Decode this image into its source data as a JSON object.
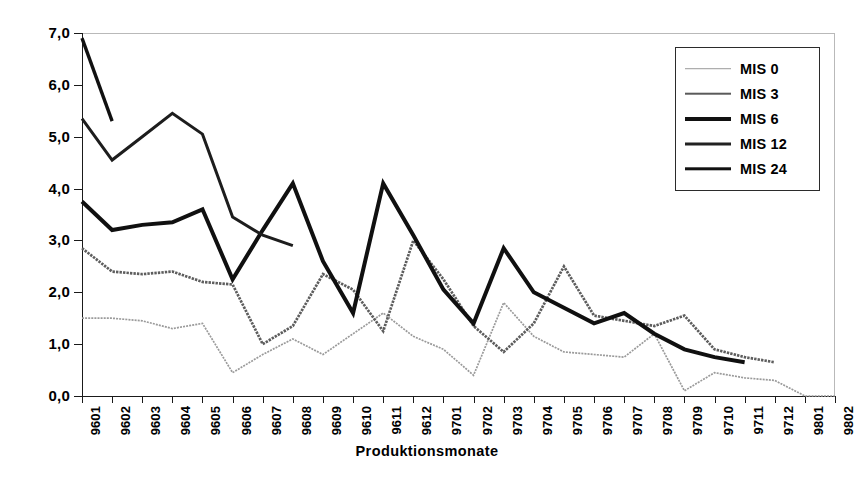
{
  "chart_data": {
    "type": "line",
    "title": "",
    "xlabel": "Produktionsmonate",
    "ylabel": "",
    "categories": [
      "9601",
      "9602",
      "9603",
      "9604",
      "9605",
      "9606",
      "9607",
      "9608",
      "9609",
      "9610",
      "9611",
      "9612",
      "9701",
      "9702",
      "9703",
      "9704",
      "9705",
      "9706",
      "9707",
      "9708",
      "9709",
      "9710",
      "9711",
      "9712",
      "9801",
      "9802"
    ],
    "ylim": [
      0,
      7
    ],
    "ytick_labels": [
      "0,0",
      "1,0",
      "2,0",
      "3,0",
      "4,0",
      "5,0",
      "6,0",
      "7,0"
    ],
    "ytick_values": [
      0,
      1,
      2,
      3,
      4,
      5,
      6,
      7
    ],
    "grid": false,
    "legend_position": "top-right",
    "series": [
      {
        "name": "MIS 0",
        "line_weight": 1.4,
        "style": "dotted-thin",
        "values": [
          1.5,
          1.5,
          1.45,
          1.3,
          1.4,
          0.45,
          0.8,
          1.1,
          0.8,
          1.2,
          1.6,
          1.15,
          0.9,
          0.4,
          1.8,
          1.15,
          0.85,
          0.8,
          0.75,
          1.2,
          0.1,
          0.45,
          0.35,
          0.3,
          0.0,
          0.0
        ]
      },
      {
        "name": "MIS 3",
        "line_weight": 2.6,
        "style": "medium",
        "values": [
          2.85,
          2.4,
          2.35,
          2.4,
          2.2,
          2.15,
          1.0,
          1.35,
          2.35,
          2.05,
          1.25,
          3.0,
          2.25,
          1.35,
          0.85,
          1.4,
          2.5,
          1.55,
          1.45,
          1.35,
          1.55,
          0.9,
          0.75,
          0.65,
          null,
          null
        ]
      },
      {
        "name": "MIS 6",
        "line_weight": 3.6,
        "style": "thick",
        "values": [
          3.75,
          3.2,
          3.3,
          3.35,
          3.6,
          2.25,
          3.2,
          4.1,
          2.6,
          1.6,
          4.1,
          3.1,
          2.05,
          1.4,
          2.85,
          2.0,
          1.7,
          1.4,
          1.6,
          1.2,
          0.9,
          0.75,
          0.65,
          null,
          null,
          null
        ]
      },
      {
        "name": "MIS 12",
        "line_weight": 2.8,
        "style": "medium-thick",
        "values": [
          5.35,
          4.55,
          5.0,
          5.45,
          5.05,
          3.45,
          3.1,
          2.9,
          null,
          null,
          null,
          null,
          null,
          null,
          null,
          null,
          null,
          null,
          null,
          null,
          null,
          null,
          null,
          null,
          null,
          null
        ]
      },
      {
        "name": "MIS 24",
        "line_weight": 3.2,
        "style": "thick-dark",
        "values": [
          6.9,
          5.3,
          null,
          null,
          null,
          null,
          null,
          null,
          null,
          null,
          null,
          null,
          null,
          null,
          null,
          null,
          null,
          null,
          null,
          null,
          null,
          null,
          null,
          null,
          null,
          null
        ]
      }
    ],
    "colors": {
      "mis0": "#8a8a8a",
      "mis3": "#4a4a4a",
      "mis6": "#111111",
      "mis12": "#111111",
      "mis24": "#111111",
      "axis": "#1a1a1a",
      "frame": "#b9b9b9",
      "background": "#ffffff"
    }
  },
  "legend": {
    "items": [
      {
        "label": "MIS 0"
      },
      {
        "label": "MIS 3"
      },
      {
        "label": "MIS 6"
      },
      {
        "label": "MIS 12"
      },
      {
        "label": "MIS 24"
      }
    ]
  }
}
